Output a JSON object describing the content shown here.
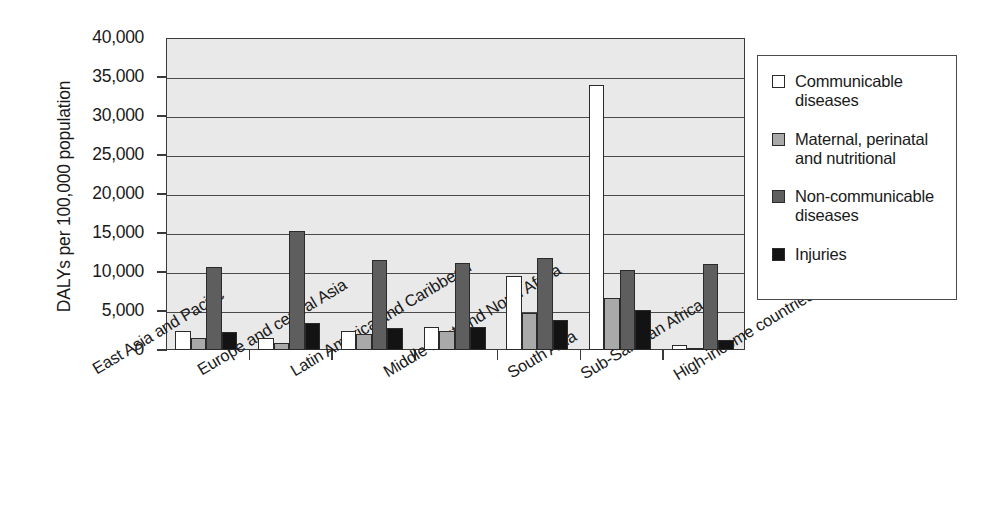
{
  "chart_data": {
    "type": "bar",
    "title": "",
    "subtitle": "",
    "xlabel": "",
    "ylabel": "DALYs per 100,000 population",
    "ylim": [
      0,
      40000
    ],
    "ytick_labels": [
      "40,000",
      "35,000",
      "30,000",
      "25,000",
      "20,000",
      "15,000",
      "10,000",
      "5,000",
      "0"
    ],
    "ytick_values": [
      40000,
      35000,
      30000,
      25000,
      20000,
      15000,
      10000,
      5000,
      0
    ],
    "grid": "horizontal",
    "legend_position": "right",
    "categories": [
      "East Asia and Pacific",
      "Europe and central Asia",
      "Latin America and Caribbean",
      "Middle East and North Africa",
      "South Asia",
      "Sub-Saharan Africa",
      "High-income countries"
    ],
    "series": [
      {
        "name": "Communicable diseases",
        "color": "#ffffff",
        "swatch_class": "swatch-communicable",
        "values": [
          2500,
          1600,
          2500,
          2900,
          9500,
          34000,
          600
        ]
      },
      {
        "name": "Maternal, perinatal and nutritional",
        "color": "#a9a9a9",
        "swatch_class": "swatch-maternal",
        "values": [
          1600,
          900,
          2000,
          2400,
          4800,
          6700,
          300
        ]
      },
      {
        "name": "Non-communicable diseases",
        "color": "#5e5e5e",
        "swatch_class": "swatch-noncomm",
        "values": [
          10700,
          15300,
          11500,
          11200,
          11800,
          10200,
          11000
        ]
      },
      {
        "name": "Injuries",
        "color": "#131313",
        "swatch_class": "swatch-injuries",
        "values": [
          2300,
          3500,
          2800,
          2900,
          3800,
          5100,
          1300
        ]
      }
    ]
  },
  "legend": {
    "items": [
      {
        "label": "Communicable diseases",
        "swatch_class": "swatch-communicable",
        "icon": "square-swatch-white"
      },
      {
        "label": "Maternal, perinatal and nutritional",
        "swatch_class": "swatch-maternal",
        "icon": "square-swatch-light-gray"
      },
      {
        "label": "Non-communicable diseases",
        "swatch_class": "swatch-noncomm",
        "icon": "square-swatch-dark-gray"
      },
      {
        "label": "Injuries",
        "swatch_class": "swatch-injuries",
        "icon": "square-swatch-black"
      }
    ]
  }
}
